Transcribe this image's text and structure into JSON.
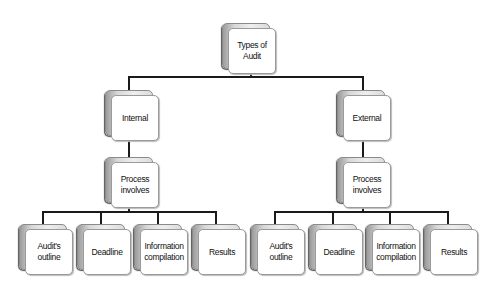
{
  "diagram": {
    "type": "tree",
    "root": {
      "label": "Types of\nAudit"
    },
    "branches": [
      {
        "label": "Internal",
        "process": {
          "label": "Process\ninvolves"
        },
        "children": [
          {
            "label": "Audit's\noutline"
          },
          {
            "label": "Deadline"
          },
          {
            "label": "Information\ncompilation"
          },
          {
            "label": "Results"
          }
        ]
      },
      {
        "label": "External",
        "process": {
          "label": "Process\ninvolves"
        },
        "children": [
          {
            "label": "Audit's\noutline"
          },
          {
            "label": "Deadline"
          },
          {
            "label": "Information\ncompilation"
          },
          {
            "label": "Results"
          }
        ]
      }
    ],
    "colors": {
      "connector": "#1a1a1a",
      "box_border": "#9a9a9a",
      "box_fill": "#ffffff",
      "shadow_box": "#d8d8d8"
    }
  }
}
